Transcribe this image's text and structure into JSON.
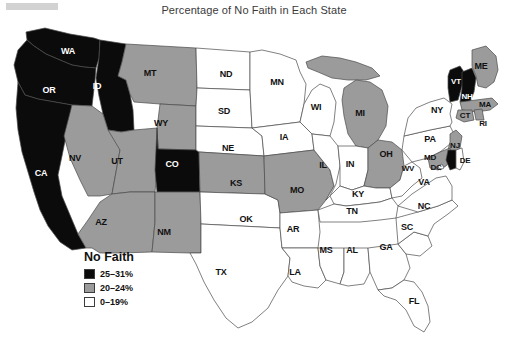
{
  "title": "Percentage of No Faith in Each State",
  "legend": {
    "heading": "No Faith",
    "items": [
      {
        "label": "25–31%",
        "color": "#0b0b0b",
        "class": "black"
      },
      {
        "label": "20–24%",
        "color": "#9b9b9b",
        "class": "gray"
      },
      {
        "label": "0–19%",
        "color": "#ffffff",
        "class": "white"
      }
    ]
  },
  "chart_data": {
    "type": "map",
    "title": "Percentage of No Faith in Each State",
    "map_region": "United States",
    "value_field": "Percentage of No Faith",
    "bins": [
      {
        "label": "25–31%",
        "min": 25,
        "max": 31,
        "color": "#0b0b0b"
      },
      {
        "label": "20–24%",
        "min": 20,
        "max": 24,
        "color": "#9b9b9b"
      },
      {
        "label": "0–19%",
        "min": 0,
        "max": 19,
        "color": "#ffffff"
      }
    ],
    "legend_position": "bottom-left",
    "states": [
      {
        "code": "WA",
        "bin": "25–31%"
      },
      {
        "code": "OR",
        "bin": "25–31%"
      },
      {
        "code": "ID",
        "bin": "25–31%"
      },
      {
        "code": "CA",
        "bin": "25–31%"
      },
      {
        "code": "CO",
        "bin": "25–31%"
      },
      {
        "code": "VT",
        "bin": "25–31%"
      },
      {
        "code": "NH",
        "bin": "25–31%"
      },
      {
        "code": "MT",
        "bin": "20–24%"
      },
      {
        "code": "WY",
        "bin": "20–24%"
      },
      {
        "code": "NV",
        "bin": "20–24%"
      },
      {
        "code": "UT",
        "bin": "20–24%"
      },
      {
        "code": "AZ",
        "bin": "20–24%"
      },
      {
        "code": "NM",
        "bin": "20–24%"
      },
      {
        "code": "KS",
        "bin": "20–24%"
      },
      {
        "code": "MO",
        "bin": "20–24%"
      },
      {
        "code": "MI",
        "bin": "20–24%"
      },
      {
        "code": "OH",
        "bin": "20–24%"
      },
      {
        "code": "ME",
        "bin": "20–24%"
      },
      {
        "code": "MA",
        "bin": "20–24%"
      },
      {
        "code": "CT",
        "bin": "20–24%"
      },
      {
        "code": "RI",
        "bin": "20–24%"
      },
      {
        "code": "NJ",
        "bin": "20–24%"
      },
      {
        "code": "MD",
        "bin": "20–24%"
      },
      {
        "code": "ND",
        "bin": "0–19%"
      },
      {
        "code": "SD",
        "bin": "0–19%"
      },
      {
        "code": "NE",
        "bin": "0–19%"
      },
      {
        "code": "MN",
        "bin": "0–19%"
      },
      {
        "code": "IA",
        "bin": "0–19%"
      },
      {
        "code": "WI",
        "bin": "0–19%"
      },
      {
        "code": "IL",
        "bin": "0–19%"
      },
      {
        "code": "IN",
        "bin": "0–19%"
      },
      {
        "code": "KY",
        "bin": "0–19%"
      },
      {
        "code": "TN",
        "bin": "0–19%"
      },
      {
        "code": "OK",
        "bin": "0–19%"
      },
      {
        "code": "AR",
        "bin": "0–19%"
      },
      {
        "code": "TX",
        "bin": "0–19%"
      },
      {
        "code": "LA",
        "bin": "0–19%"
      },
      {
        "code": "MS",
        "bin": "0–19%"
      },
      {
        "code": "AL",
        "bin": "0–19%"
      },
      {
        "code": "GA",
        "bin": "0–19%"
      },
      {
        "code": "FL",
        "bin": "0–19%"
      },
      {
        "code": "SC",
        "bin": "0–19%"
      },
      {
        "code": "NC",
        "bin": "0–19%"
      },
      {
        "code": "VA",
        "bin": "0–19%"
      },
      {
        "code": "WV",
        "bin": "0–19%"
      },
      {
        "code": "PA",
        "bin": "0–19%"
      },
      {
        "code": "NY",
        "bin": "0–19%"
      },
      {
        "code": "DE",
        "bin": "0–19%"
      },
      {
        "code": "DC",
        "bin": "0–19%"
      }
    ]
  },
  "labels": [
    {
      "code": "WA",
      "x": 68,
      "y": 41,
      "dark": true,
      "size": ""
    },
    {
      "code": "OR",
      "x": 49,
      "y": 80,
      "dark": true,
      "size": ""
    },
    {
      "code": "ID",
      "x": 97,
      "y": 76,
      "dark": true,
      "size": ""
    },
    {
      "code": "MT",
      "x": 150,
      "y": 63,
      "dark": false,
      "size": ""
    },
    {
      "code": "WY",
      "x": 161,
      "y": 113,
      "dark": false,
      "size": ""
    },
    {
      "code": "CA",
      "x": 41,
      "y": 163,
      "dark": true,
      "size": ""
    },
    {
      "code": "NV",
      "x": 75,
      "y": 148,
      "dark": false,
      "size": ""
    },
    {
      "code": "UT",
      "x": 117,
      "y": 151,
      "dark": false,
      "size": ""
    },
    {
      "code": "CO",
      "x": 172,
      "y": 154,
      "dark": true,
      "size": ""
    },
    {
      "code": "AZ",
      "x": 101,
      "y": 212,
      "dark": false,
      "size": ""
    },
    {
      "code": "NM",
      "x": 164,
      "y": 222,
      "dark": false,
      "size": ""
    },
    {
      "code": "ND",
      "x": 226,
      "y": 64,
      "dark": false,
      "size": ""
    },
    {
      "code": "SD",
      "x": 224,
      "y": 101,
      "dark": false,
      "size": ""
    },
    {
      "code": "NE",
      "x": 228,
      "y": 138,
      "dark": false,
      "size": ""
    },
    {
      "code": "KS",
      "x": 236,
      "y": 173,
      "dark": false,
      "size": ""
    },
    {
      "code": "OK",
      "x": 246,
      "y": 209,
      "dark": false,
      "size": ""
    },
    {
      "code": "TX",
      "x": 221,
      "y": 262,
      "dark": false,
      "size": ""
    },
    {
      "code": "MN",
      "x": 277,
      "y": 72,
      "dark": false,
      "size": ""
    },
    {
      "code": "IA",
      "x": 284,
      "y": 127,
      "dark": false,
      "size": ""
    },
    {
      "code": "MO",
      "x": 297,
      "y": 180,
      "dark": false,
      "size": ""
    },
    {
      "code": "AR",
      "x": 293,
      "y": 219,
      "dark": false,
      "size": ""
    },
    {
      "code": "LA",
      "x": 295,
      "y": 262,
      "dark": false,
      "size": ""
    },
    {
      "code": "WI",
      "x": 316,
      "y": 97,
      "dark": false,
      "size": ""
    },
    {
      "code": "IL",
      "x": 323,
      "y": 155,
      "dark": false,
      "size": ""
    },
    {
      "code": "MS",
      "x": 326,
      "y": 240,
      "dark": false,
      "size": ""
    },
    {
      "code": "MI",
      "x": 360,
      "y": 103,
      "dark": false,
      "size": ""
    },
    {
      "code": "IN",
      "x": 350,
      "y": 154,
      "dark": false,
      "size": ""
    },
    {
      "code": "KY",
      "x": 358,
      "y": 184,
      "dark": false,
      "size": ""
    },
    {
      "code": "TN",
      "x": 352,
      "y": 201,
      "dark": false,
      "size": ""
    },
    {
      "code": "AL",
      "x": 352,
      "y": 240,
      "dark": false,
      "size": ""
    },
    {
      "code": "OH",
      "x": 386,
      "y": 144,
      "dark": false,
      "size": ""
    },
    {
      "code": "WV",
      "x": 408,
      "y": 158,
      "dark": false,
      "size": "small"
    },
    {
      "code": "GA",
      "x": 386,
      "y": 237,
      "dark": false,
      "size": ""
    },
    {
      "code": "FL",
      "x": 414,
      "y": 291,
      "dark": false,
      "size": ""
    },
    {
      "code": "SC",
      "x": 407,
      "y": 217,
      "dark": false,
      "size": ""
    },
    {
      "code": "NC",
      "x": 424,
      "y": 196,
      "dark": false,
      "size": ""
    },
    {
      "code": "VA",
      "x": 424,
      "y": 172,
      "dark": false,
      "size": ""
    },
    {
      "code": "DC",
      "x": 436,
      "y": 157,
      "dark": false,
      "size": "small"
    },
    {
      "code": "MD",
      "x": 430,
      "y": 147,
      "dark": false,
      "size": "small"
    },
    {
      "code": "DE",
      "x": 465,
      "y": 150,
      "dark": false,
      "size": "small"
    },
    {
      "code": "NJ",
      "x": 455,
      "y": 135,
      "dark": false,
      "size": "small"
    },
    {
      "code": "PA",
      "x": 430,
      "y": 129,
      "dark": false,
      "size": ""
    },
    {
      "code": "NY",
      "x": 437,
      "y": 100,
      "dark": false,
      "size": ""
    },
    {
      "code": "VT",
      "x": 456,
      "y": 71,
      "dark": true,
      "size": "small"
    },
    {
      "code": "NH",
      "x": 467,
      "y": 86,
      "dark": true,
      "size": "small"
    },
    {
      "code": "ME",
      "x": 481,
      "y": 56,
      "dark": false,
      "size": ""
    },
    {
      "code": "MA",
      "x": 485,
      "y": 94,
      "dark": false,
      "size": "small"
    },
    {
      "code": "CT",
      "x": 465,
      "y": 105,
      "dark": false,
      "size": "small"
    },
    {
      "code": "RI",
      "x": 483,
      "y": 113,
      "dark": false,
      "size": "small"
    }
  ]
}
